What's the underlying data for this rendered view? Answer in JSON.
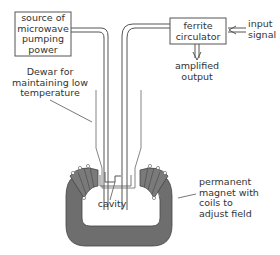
{
  "diagram": {
    "type": "maser amplifier schematic",
    "labels": {
      "pump_source": [
        "source of",
        "microwave",
        "pumping",
        "power"
      ],
      "circulator": [
        "ferrite",
        "circulator"
      ],
      "input": [
        "input",
        "signal"
      ],
      "output": [
        "amplified",
        "output"
      ],
      "dewar": [
        "Dewar for",
        "maintaining low",
        "temperature"
      ],
      "cavity": "cavity",
      "magnet": [
        "permanent",
        "magnet with",
        "coils to",
        "adjust field"
      ]
    },
    "colors": {
      "line": "#555555",
      "magnet_fill": "#6e6e6e",
      "text": "#333333"
    }
  }
}
